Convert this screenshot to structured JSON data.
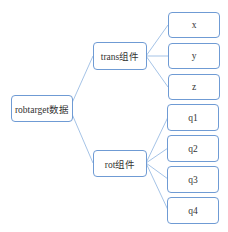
{
  "diagram": {
    "type": "tree",
    "root": {
      "label": "robtarget数据"
    },
    "branches": [
      {
        "label": "trans组件",
        "children": [
          "x",
          "y",
          "z"
        ]
      },
      {
        "label": "rot组件",
        "children": [
          "q1",
          "q2",
          "q3",
          "q4"
        ]
      }
    ],
    "colors": {
      "border": "#6f9bd4",
      "line": "#9bbce3",
      "text": "#333333"
    }
  }
}
